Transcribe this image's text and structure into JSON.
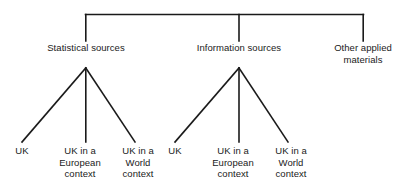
{
  "diagram": {
    "type": "hierarchy-tree",
    "orientation": "top-down",
    "stroke_color": "#1a1a1a",
    "background_color": "#ffffff",
    "text_color": "#1a1a1a",
    "levels": 2,
    "root": {
      "label": "",
      "visible": false
    },
    "level1": {
      "statistical_sources": "Statistical sources",
      "information_sources": "Information sources",
      "other_applied_materials": "Other applied\nmaterials"
    },
    "leaves": {
      "stat_uk": "UK",
      "stat_european": "UK in a\nEuropean\ncontext",
      "stat_world": "UK in a\nWorld\ncontext",
      "info_uk": "UK",
      "info_european": "UK in a\nEuropean\ncontext",
      "info_world": "UK in a\nWorld\ncontext"
    }
  }
}
